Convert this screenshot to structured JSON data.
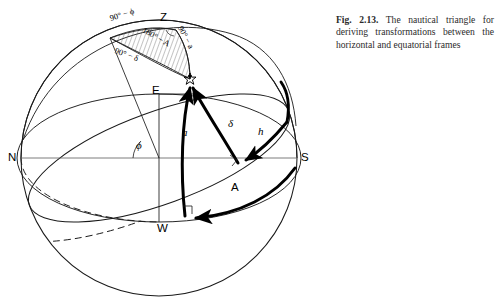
{
  "figure": {
    "caption_label": "Fig. 2.13.",
    "caption_text": "The nautical triangle for deriving transformations between the horizontal and equatorial frames"
  },
  "diagram": {
    "type": "celestial-sphere",
    "title": "nautical triangle",
    "cardinal_points": [
      {
        "key": "north",
        "label": "N",
        "x": 8,
        "y": 151
      },
      {
        "key": "south",
        "label": "S",
        "x": 301,
        "y": 151
      },
      {
        "key": "east",
        "label": "E",
        "x": 152,
        "y": 84
      },
      {
        "key": "west",
        "label": "W",
        "x": 157,
        "y": 222
      }
    ],
    "zenith": {
      "label": "Z",
      "x": 160,
      "y": 11
    },
    "star": {
      "label": "☆",
      "x": 184,
      "y": 72
    },
    "triangle_sides": [
      {
        "key": "colatitude",
        "label": "90° − ϕ",
        "x": 110,
        "y": 14
      },
      {
        "key": "zenith-distance",
        "label": "90° − a",
        "x": 180,
        "y": 22
      },
      {
        "key": "polar-distance",
        "label": "90° − δ",
        "x": 115,
        "y": 46
      }
    ],
    "triangle_angles": [
      {
        "key": "parallactic-azimuth",
        "label": "180° − A",
        "x": 143,
        "y": 25
      }
    ],
    "arc_labels": [
      {
        "key": "altitude",
        "label": "a",
        "x": 182,
        "y": 126
      },
      {
        "key": "declination",
        "label": "δ",
        "x": 228,
        "y": 117
      },
      {
        "key": "hour-angle",
        "label": "h",
        "x": 258,
        "y": 125
      },
      {
        "key": "azimuth",
        "label": "A",
        "x": 231,
        "y": 181
      },
      {
        "key": "latitude",
        "label": "ϕ",
        "x": 136,
        "y": 139
      }
    ]
  },
  "colors": {
    "ink": "#000000",
    "thin_line": "#1a1a1a",
    "hatch": "#555555",
    "caption": "#2b2b2b",
    "background": "#ffffff"
  }
}
